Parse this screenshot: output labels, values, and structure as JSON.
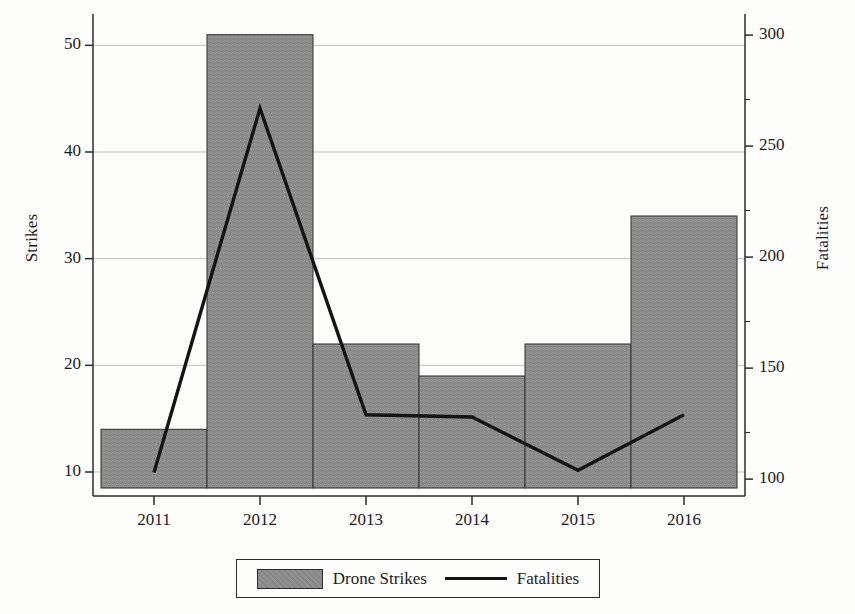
{
  "chart_data": {
    "type": "bar",
    "title": "",
    "xlabel": "",
    "ylabel": "Strikes",
    "y2label": "Fatalities",
    "categories": [
      "2011",
      "2012",
      "2013",
      "2014",
      "2015",
      "2016"
    ],
    "grid": true,
    "legend_position": "bottom",
    "ylim": [
      8.5,
      52
    ],
    "y2lim": [
      96,
      305
    ],
    "yticks": [
      "10",
      "20",
      "30",
      "40",
      "50"
    ],
    "ytick_values": [
      10,
      20,
      30,
      40,
      50
    ],
    "y2ticks": [
      "100",
      "150",
      "200",
      "250",
      "300"
    ],
    "y2tick_values": [
      100,
      150,
      200,
      250,
      300
    ],
    "series": [
      {
        "name": "Drone Strikes",
        "type": "bar",
        "axis": "left",
        "color": "#8c8c8c",
        "edge_color": "#3a3a3a",
        "values": [
          14,
          51,
          22,
          19,
          22,
          34
        ]
      },
      {
        "name": "Fatalities",
        "type": "line",
        "axis": "right",
        "color": "#141414",
        "values": [
          103,
          267,
          129,
          128,
          104,
          129
        ]
      }
    ]
  },
  "legend": {
    "items": [
      {
        "label": "Drone Strikes",
        "marker": "bar-swatch-icon"
      },
      {
        "label": "Fatalities",
        "marker": "line-swatch-icon"
      }
    ]
  },
  "axes": {
    "left_title": "Strikes",
    "right_title": "Fatalities"
  }
}
